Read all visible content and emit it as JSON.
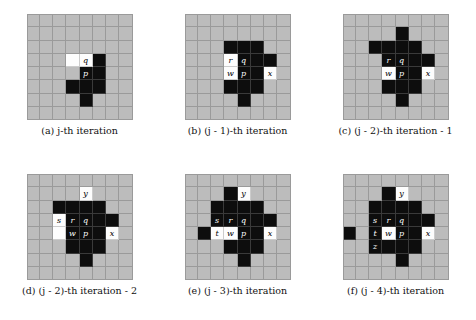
{
  "figure": {
    "title": "",
    "grid": {
      "cols": 8,
      "rows": 8,
      "cell_px": 13.25
    },
    "colors": {
      "background": "#bcbcbc",
      "gridline": "#9a9a9a",
      "filled": "#0d0d0d",
      "highlight": "#fdfdfd",
      "page": "#ffffff"
    },
    "panels": [
      {
        "id": "a",
        "caption": "(a) j-th iteration",
        "caption_prefix": "(a)",
        "caption_var": "j",
        "caption_suffix": "-th iteration",
        "cells": [
          {
            "col": 3,
            "row": 3,
            "state": "white",
            "label": ""
          },
          {
            "col": 4,
            "row": 3,
            "state": "white",
            "label": "q"
          },
          {
            "col": 5,
            "row": 3,
            "state": "black",
            "label": ""
          },
          {
            "col": 4,
            "row": 4,
            "state": "black",
            "label": "p"
          },
          {
            "col": 5,
            "row": 4,
            "state": "black",
            "label": ""
          },
          {
            "col": 3,
            "row": 5,
            "state": "black",
            "label": ""
          },
          {
            "col": 4,
            "row": 5,
            "state": "black",
            "label": ""
          },
          {
            "col": 5,
            "row": 5,
            "state": "black",
            "label": ""
          },
          {
            "col": 4,
            "row": 6,
            "state": "black",
            "label": ""
          }
        ]
      },
      {
        "id": "b",
        "caption": "(b) (j - 1)-th iteration",
        "caption_prefix": "(b)",
        "caption_var": "j",
        "caption_suffix": "-th iteration",
        "caption_offset": "1",
        "cells": [
          {
            "col": 3,
            "row": 2,
            "state": "black",
            "label": ""
          },
          {
            "col": 4,
            "row": 2,
            "state": "black",
            "label": ""
          },
          {
            "col": 5,
            "row": 2,
            "state": "black",
            "label": ""
          },
          {
            "col": 3,
            "row": 3,
            "state": "white",
            "label": "r"
          },
          {
            "col": 4,
            "row": 3,
            "state": "black",
            "label": "q"
          },
          {
            "col": 5,
            "row": 3,
            "state": "black",
            "label": ""
          },
          {
            "col": 6,
            "row": 3,
            "state": "black",
            "label": ""
          },
          {
            "col": 3,
            "row": 4,
            "state": "white",
            "label": "w"
          },
          {
            "col": 4,
            "row": 4,
            "state": "black",
            "label": "p"
          },
          {
            "col": 5,
            "row": 4,
            "state": "black",
            "label": ""
          },
          {
            "col": 6,
            "row": 4,
            "state": "white",
            "label": "x"
          },
          {
            "col": 3,
            "row": 5,
            "state": "black",
            "label": ""
          },
          {
            "col": 4,
            "row": 5,
            "state": "black",
            "label": ""
          },
          {
            "col": 5,
            "row": 5,
            "state": "black",
            "label": ""
          },
          {
            "col": 4,
            "row": 6,
            "state": "black",
            "label": ""
          }
        ]
      },
      {
        "id": "c",
        "caption": "(c) (j - 2)-th iteration - 1",
        "caption_prefix": "(c)",
        "caption_var": "j",
        "caption_suffix": "-th iteration - 1",
        "caption_offset": "2",
        "cells": [
          {
            "col": 4,
            "row": 1,
            "state": "black",
            "label": ""
          },
          {
            "col": 2,
            "row": 2,
            "state": "black",
            "label": ""
          },
          {
            "col": 3,
            "row": 2,
            "state": "black",
            "label": ""
          },
          {
            "col": 4,
            "row": 2,
            "state": "black",
            "label": ""
          },
          {
            "col": 5,
            "row": 2,
            "state": "black",
            "label": ""
          },
          {
            "col": 3,
            "row": 3,
            "state": "black",
            "label": "r"
          },
          {
            "col": 4,
            "row": 3,
            "state": "black",
            "label": "q"
          },
          {
            "col": 5,
            "row": 3,
            "state": "black",
            "label": ""
          },
          {
            "col": 6,
            "row": 3,
            "state": "black",
            "label": ""
          },
          {
            "col": 3,
            "row": 4,
            "state": "white",
            "label": "w"
          },
          {
            "col": 4,
            "row": 4,
            "state": "black",
            "label": "p"
          },
          {
            "col": 5,
            "row": 4,
            "state": "black",
            "label": ""
          },
          {
            "col": 6,
            "row": 4,
            "state": "white",
            "label": "x"
          },
          {
            "col": 3,
            "row": 5,
            "state": "black",
            "label": ""
          },
          {
            "col": 4,
            "row": 5,
            "state": "black",
            "label": ""
          },
          {
            "col": 5,
            "row": 5,
            "state": "black",
            "label": ""
          },
          {
            "col": 4,
            "row": 6,
            "state": "black",
            "label": ""
          }
        ]
      },
      {
        "id": "d",
        "caption": "(d) (j - 2)-th iteration - 2",
        "caption_prefix": "(d)",
        "caption_var": "j",
        "caption_suffix": "-th iteration - 2",
        "caption_offset": "2",
        "cells": [
          {
            "col": 4,
            "row": 1,
            "state": "white",
            "label": "y"
          },
          {
            "col": 2,
            "row": 2,
            "state": "black",
            "label": ""
          },
          {
            "col": 3,
            "row": 2,
            "state": "black",
            "label": ""
          },
          {
            "col": 4,
            "row": 2,
            "state": "black",
            "label": ""
          },
          {
            "col": 5,
            "row": 2,
            "state": "black",
            "label": ""
          },
          {
            "col": 2,
            "row": 3,
            "state": "white",
            "label": "s"
          },
          {
            "col": 3,
            "row": 3,
            "state": "black",
            "label": "r"
          },
          {
            "col": 4,
            "row": 3,
            "state": "black",
            "label": "q"
          },
          {
            "col": 5,
            "row": 3,
            "state": "black",
            "label": ""
          },
          {
            "col": 6,
            "row": 3,
            "state": "black",
            "label": ""
          },
          {
            "col": 2,
            "row": 4,
            "state": "white",
            "label": ""
          },
          {
            "col": 3,
            "row": 4,
            "state": "black",
            "label": "w"
          },
          {
            "col": 4,
            "row": 4,
            "state": "black",
            "label": "p"
          },
          {
            "col": 5,
            "row": 4,
            "state": "black",
            "label": ""
          },
          {
            "col": 6,
            "row": 4,
            "state": "white",
            "label": "x"
          },
          {
            "col": 3,
            "row": 5,
            "state": "black",
            "label": ""
          },
          {
            "col": 4,
            "row": 5,
            "state": "black",
            "label": ""
          },
          {
            "col": 5,
            "row": 5,
            "state": "black",
            "label": ""
          },
          {
            "col": 4,
            "row": 6,
            "state": "black",
            "label": ""
          }
        ]
      },
      {
        "id": "e",
        "caption": "(e) (j - 3)-th iteration",
        "caption_prefix": "(e)",
        "caption_var": "j",
        "caption_suffix": "-th iteration",
        "caption_offset": "3",
        "cells": [
          {
            "col": 3,
            "row": 1,
            "state": "black",
            "label": ""
          },
          {
            "col": 4,
            "row": 1,
            "state": "white",
            "label": "y"
          },
          {
            "col": 2,
            "row": 2,
            "state": "black",
            "label": ""
          },
          {
            "col": 3,
            "row": 2,
            "state": "black",
            "label": ""
          },
          {
            "col": 4,
            "row": 2,
            "state": "black",
            "label": ""
          },
          {
            "col": 5,
            "row": 2,
            "state": "black",
            "label": ""
          },
          {
            "col": 2,
            "row": 3,
            "state": "black",
            "label": "s"
          },
          {
            "col": 3,
            "row": 3,
            "state": "black",
            "label": "r"
          },
          {
            "col": 4,
            "row": 3,
            "state": "black",
            "label": "q"
          },
          {
            "col": 5,
            "row": 3,
            "state": "black",
            "label": ""
          },
          {
            "col": 6,
            "row": 3,
            "state": "black",
            "label": ""
          },
          {
            "col": 1,
            "row": 4,
            "state": "black",
            "label": ""
          },
          {
            "col": 2,
            "row": 4,
            "state": "white",
            "label": "t"
          },
          {
            "col": 3,
            "row": 4,
            "state": "white",
            "label": "w"
          },
          {
            "col": 4,
            "row": 4,
            "state": "black",
            "label": "p"
          },
          {
            "col": 5,
            "row": 4,
            "state": "black",
            "label": ""
          },
          {
            "col": 6,
            "row": 4,
            "state": "white",
            "label": "x"
          },
          {
            "col": 3,
            "row": 5,
            "state": "black",
            "label": ""
          },
          {
            "col": 4,
            "row": 5,
            "state": "black",
            "label": ""
          },
          {
            "col": 5,
            "row": 5,
            "state": "black",
            "label": ""
          },
          {
            "col": 4,
            "row": 6,
            "state": "black",
            "label": ""
          }
        ]
      },
      {
        "id": "f",
        "caption": "(f) (j - 4)-th iteration",
        "caption_prefix": "(f)",
        "caption_var": "j",
        "caption_suffix": "-th iteration",
        "caption_offset": "4",
        "cells": [
          {
            "col": 3,
            "row": 1,
            "state": "black",
            "label": ""
          },
          {
            "col": 4,
            "row": 1,
            "state": "white",
            "label": "y"
          },
          {
            "col": 2,
            "row": 2,
            "state": "black",
            "label": ""
          },
          {
            "col": 3,
            "row": 2,
            "state": "black",
            "label": ""
          },
          {
            "col": 4,
            "row": 2,
            "state": "black",
            "label": ""
          },
          {
            "col": 5,
            "row": 2,
            "state": "black",
            "label": ""
          },
          {
            "col": 2,
            "row": 3,
            "state": "black",
            "label": "s"
          },
          {
            "col": 3,
            "row": 3,
            "state": "black",
            "label": "r"
          },
          {
            "col": 4,
            "row": 3,
            "state": "black",
            "label": "q"
          },
          {
            "col": 5,
            "row": 3,
            "state": "black",
            "label": ""
          },
          {
            "col": 6,
            "row": 3,
            "state": "black",
            "label": ""
          },
          {
            "col": 0,
            "row": 4,
            "state": "black",
            "label": ""
          },
          {
            "col": 2,
            "row": 4,
            "state": "black",
            "label": "t"
          },
          {
            "col": 3,
            "row": 4,
            "state": "white",
            "label": "w"
          },
          {
            "col": 4,
            "row": 4,
            "state": "black",
            "label": "p"
          },
          {
            "col": 5,
            "row": 4,
            "state": "black",
            "label": ""
          },
          {
            "col": 6,
            "row": 4,
            "state": "white",
            "label": "x"
          },
          {
            "col": 2,
            "row": 5,
            "state": "black",
            "label": "z"
          },
          {
            "col": 3,
            "row": 5,
            "state": "black",
            "label": ""
          },
          {
            "col": 4,
            "row": 5,
            "state": "black",
            "label": ""
          },
          {
            "col": 5,
            "row": 5,
            "state": "black",
            "label": ""
          },
          {
            "col": 4,
            "row": 6,
            "state": "black",
            "label": ""
          }
        ]
      }
    ]
  }
}
